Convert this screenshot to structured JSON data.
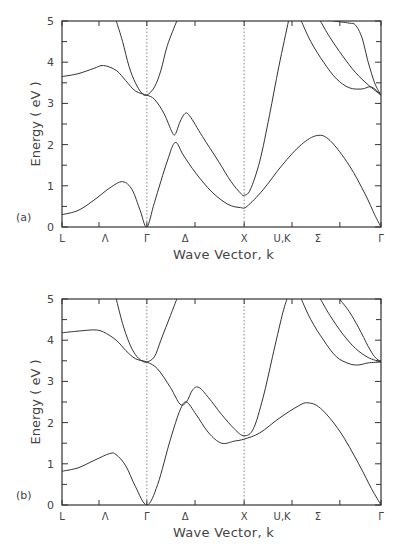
{
  "chart_data": [
    {
      "type": "line",
      "panel_label": "(a)",
      "title": "",
      "xlabel": "Wave Vector, k",
      "ylabel": "Energy ( eV )",
      "ylim": [
        0,
        5
      ],
      "yticks": [
        "0",
        "1",
        "2",
        "3",
        "4",
        "5"
      ],
      "x_tick_labels": [
        "L",
        "Λ",
        "Γ",
        "Δ",
        "X",
        "U,K",
        "Σ",
        "Γ"
      ],
      "x_tick_label_pos": [
        0,
        0.135,
        0.266,
        0.386,
        0.571,
        0.69,
        0.802,
        1.0
      ],
      "x_tick_pos": [
        0,
        0.116,
        0.266,
        0.417,
        0.571,
        0.721,
        0.871,
        1.0
      ],
      "dotted_verticals": [
        0.266,
        0.571
      ],
      "grid": false,
      "series": [
        {
          "name": "band1",
          "points": [
            [
              0,
              0.3
            ],
            [
              0.05,
              0.4
            ],
            [
              0.1,
              0.65
            ],
            [
              0.15,
              0.95
            ],
            [
              0.19,
              1.1
            ],
            [
              0.22,
              0.9
            ],
            [
              0.245,
              0.4
            ],
            [
              0.266,
              0.0
            ],
            [
              0.29,
              0.6
            ],
            [
              0.33,
              1.6
            ],
            [
              0.355,
              2.05
            ],
            [
              0.38,
              1.75
            ],
            [
              0.42,
              1.3
            ],
            [
              0.47,
              0.85
            ],
            [
              0.52,
              0.55
            ],
            [
              0.56,
              0.47
            ],
            [
              0.58,
              0.5
            ],
            [
              0.63,
              0.9
            ],
            [
              0.69,
              1.5
            ],
            [
              0.75,
              2.0
            ],
            [
              0.8,
              2.22
            ],
            [
              0.84,
              2.1
            ],
            [
              0.9,
              1.5
            ],
            [
              0.95,
              0.8
            ],
            [
              0.98,
              0.3
            ],
            [
              1.0,
              0.0
            ]
          ]
        },
        {
          "name": "band2",
          "points": [
            [
              0,
              3.65
            ],
            [
              0.05,
              3.72
            ],
            [
              0.1,
              3.85
            ],
            [
              0.13,
              3.92
            ],
            [
              0.17,
              3.8
            ],
            [
              0.2,
              3.55
            ],
            [
              0.23,
              3.3
            ],
            [
              0.266,
              3.2
            ],
            [
              0.29,
              3.1
            ],
            [
              0.32,
              2.75
            ],
            [
              0.345,
              2.3
            ],
            [
              0.355,
              2.25
            ],
            [
              0.37,
              2.55
            ],
            [
              0.385,
              2.75
            ],
            [
              0.4,
              2.7
            ],
            [
              0.44,
              2.2
            ],
            [
              0.49,
              1.6
            ],
            [
              0.53,
              1.1
            ],
            [
              0.56,
              0.82
            ],
            [
              0.571,
              0.77
            ],
            [
              0.59,
              0.9
            ],
            [
              0.62,
              1.6
            ],
            [
              0.65,
              2.7
            ],
            [
              0.68,
              3.9
            ],
            [
              0.71,
              5.0
            ]
          ]
        },
        {
          "name": "band3",
          "points": [
            [
              0.17,
              5.0
            ],
            [
              0.19,
              4.5
            ],
            [
              0.21,
              3.9
            ],
            [
              0.23,
              3.5
            ],
            [
              0.25,
              3.25
            ],
            [
              0.266,
              3.2
            ],
            [
              0.29,
              3.4
            ],
            [
              0.31,
              3.8
            ],
            [
              0.33,
              4.4
            ],
            [
              0.36,
              5.0
            ]
          ]
        },
        {
          "name": "band4",
          "points": [
            [
              0.75,
              5.0
            ],
            [
              0.78,
              4.5
            ],
            [
              0.82,
              4.0
            ],
            [
              0.86,
              3.6
            ],
            [
              0.9,
              3.38
            ],
            [
              0.94,
              3.35
            ],
            [
              0.97,
              3.4
            ],
            [
              1.0,
              3.2
            ]
          ]
        },
        {
          "name": "band5",
          "points": [
            [
              0.81,
              5.0
            ],
            [
              0.84,
              4.6
            ],
            [
              0.88,
              4.15
            ],
            [
              0.92,
              3.75
            ],
            [
              0.96,
              3.45
            ],
            [
              1.0,
              3.2
            ]
          ]
        },
        {
          "name": "band6",
          "points": [
            [
              0.85,
              5.0
            ],
            [
              0.9,
              4.95
            ],
            [
              0.92,
              4.9
            ],
            [
              0.94,
              4.6
            ],
            [
              0.96,
              4.0
            ],
            [
              0.98,
              3.5
            ],
            [
              1.0,
              3.2
            ]
          ]
        }
      ]
    },
    {
      "type": "line",
      "panel_label": "(b)",
      "title": "",
      "xlabel": "Wave Vector, k",
      "ylabel": "Energy ( eV )",
      "ylim": [
        0,
        5
      ],
      "yticks": [
        "0",
        "1",
        "2",
        "3",
        "4",
        "5"
      ],
      "x_tick_labels": [
        "L",
        "Λ",
        "Γ",
        "Δ",
        "X",
        "U,K",
        "Σ",
        "Γ"
      ],
      "x_tick_label_pos": [
        0,
        0.135,
        0.266,
        0.386,
        0.571,
        0.69,
        0.802,
        1.0
      ],
      "x_tick_pos": [
        0,
        0.116,
        0.266,
        0.417,
        0.571,
        0.721,
        0.871,
        1.0
      ],
      "dotted_verticals": [
        0.266,
        0.571
      ],
      "grid": false,
      "series": [
        {
          "name": "band1",
          "points": [
            [
              0,
              0.82
            ],
            [
              0.05,
              0.9
            ],
            [
              0.1,
              1.08
            ],
            [
              0.15,
              1.25
            ],
            [
              0.17,
              1.22
            ],
            [
              0.2,
              0.95
            ],
            [
              0.23,
              0.45
            ],
            [
              0.266,
              0.0
            ],
            [
              0.3,
              0.5
            ],
            [
              0.34,
              1.6
            ],
            [
              0.37,
              2.3
            ],
            [
              0.39,
              2.5
            ],
            [
              0.42,
              2.2
            ],
            [
              0.46,
              1.75
            ],
            [
              0.5,
              1.5
            ],
            [
              0.54,
              1.55
            ],
            [
              0.571,
              1.6
            ],
            [
              0.62,
              1.75
            ],
            [
              0.68,
              2.1
            ],
            [
              0.74,
              2.4
            ],
            [
              0.77,
              2.48
            ],
            [
              0.81,
              2.35
            ],
            [
              0.87,
              1.8
            ],
            [
              0.93,
              1.0
            ],
            [
              0.97,
              0.4
            ],
            [
              1.0,
              0.0
            ]
          ]
        },
        {
          "name": "band2",
          "points": [
            [
              0,
              4.18
            ],
            [
              0.05,
              4.22
            ],
            [
              0.1,
              4.25
            ],
            [
              0.13,
              4.2
            ],
            [
              0.17,
              4.0
            ],
            [
              0.2,
              3.75
            ],
            [
              0.23,
              3.55
            ],
            [
              0.266,
              3.47
            ],
            [
              0.3,
              3.3
            ],
            [
              0.34,
              2.85
            ],
            [
              0.37,
              2.45
            ],
            [
              0.39,
              2.5
            ],
            [
              0.41,
              2.8
            ],
            [
              0.43,
              2.85
            ],
            [
              0.46,
              2.6
            ],
            [
              0.5,
              2.2
            ],
            [
              0.54,
              1.85
            ],
            [
              0.571,
              1.68
            ],
            [
              0.6,
              1.85
            ],
            [
              0.63,
              2.6
            ],
            [
              0.66,
              3.6
            ],
            [
              0.69,
              4.6
            ],
            [
              0.705,
              5.0
            ]
          ]
        },
        {
          "name": "band3",
          "points": [
            [
              0.17,
              5.0
            ],
            [
              0.19,
              4.4
            ],
            [
              0.21,
              3.95
            ],
            [
              0.23,
              3.65
            ],
            [
              0.25,
              3.5
            ],
            [
              0.266,
              3.47
            ],
            [
              0.29,
              3.6
            ],
            [
              0.31,
              4.0
            ],
            [
              0.34,
              4.6
            ],
            [
              0.36,
              5.0
            ]
          ]
        },
        {
          "name": "band4",
          "points": [
            [
              0.75,
              5.0
            ],
            [
              0.78,
              4.5
            ],
            [
              0.82,
              4.0
            ],
            [
              0.86,
              3.6
            ],
            [
              0.9,
              3.43
            ],
            [
              0.93,
              3.4
            ],
            [
              0.96,
              3.45
            ],
            [
              1.0,
              3.47
            ]
          ]
        },
        {
          "name": "band5",
          "points": [
            [
              0.81,
              5.0
            ],
            [
              0.84,
              4.6
            ],
            [
              0.88,
              4.15
            ],
            [
              0.92,
              3.8
            ],
            [
              0.96,
              3.58
            ],
            [
              1.0,
              3.47
            ]
          ]
        },
        {
          "name": "band6",
          "points": [
            [
              0.87,
              5.0
            ],
            [
              0.9,
              4.7
            ],
            [
              0.93,
              4.3
            ],
            [
              0.96,
              3.85
            ],
            [
              0.98,
              3.6
            ],
            [
              1.0,
              3.47
            ]
          ]
        }
      ]
    }
  ],
  "panels": [
    {
      "label": "(a)",
      "xlabel": "Wave Vector, k",
      "ylabel": "Energy ( eV )"
    },
    {
      "label": "(b)",
      "xlabel": "Wave Vector, k",
      "ylabel": "Energy ( eV )"
    }
  ],
  "colors": {
    "axis": "#333333",
    "curve": "#333333",
    "dotted": "#888888",
    "text": "#444444"
  }
}
